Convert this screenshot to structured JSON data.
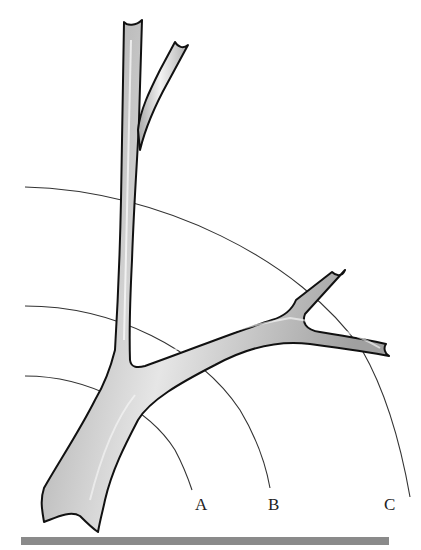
{
  "diagram": {
    "labels": {
      "a": "A",
      "b": "B",
      "c": "C"
    },
    "colors": {
      "vessel_fill": "#d8d8d8",
      "vessel_outline": "#111111",
      "arc_stroke": "#333333",
      "baseline_bar": "#8a8a8a"
    }
  }
}
